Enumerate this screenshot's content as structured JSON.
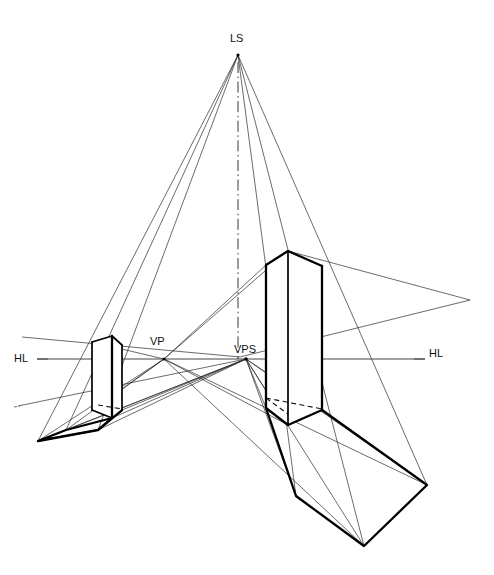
{
  "figure": {
    "type": "technical-line-drawing",
    "background_color": "#ffffff",
    "line_color": "#000000",
    "width": 494,
    "height": 575
  },
  "labels": {
    "light_source": "LS",
    "vanishing_point": "VP",
    "vanishing_point_shadow": "VPS",
    "horizon_left": "HL",
    "horizon_right": "HL"
  },
  "points": {
    "LS": {
      "x": 238,
      "y": 55,
      "label": "LS",
      "label_x": 232,
      "label_y": 40
    },
    "VP": {
      "x": 164,
      "y": 359,
      "label": "VP",
      "label_x": 152,
      "label_y": 347
    },
    "VPS": {
      "x": 246,
      "y": 359,
      "label": "VPS",
      "label_x": 235,
      "label_y": 351
    },
    "HL_left_label": {
      "label": "HL",
      "label_x": 16,
      "label_y": 359
    },
    "HL_right_label": {
      "label": "HL",
      "label_x": 430,
      "label_y": 357
    }
  },
  "horizon_line": {
    "left_x": 37,
    "right_x": 425,
    "y": 359
  },
  "center_line": {
    "x": 238,
    "top_y": 60,
    "bottom_y": 359
  },
  "left_object": {
    "name": "left-vertical-prism",
    "top_back_left": {
      "x": 92,
      "y": 342
    },
    "top_front": {
      "x": 112,
      "y": 336
    },
    "top_right": {
      "x": 122,
      "y": 345
    },
    "top_back_inner": {
      "x": 102,
      "y": 351
    },
    "bottom_back_left": {
      "x": 92,
      "y": 410
    },
    "bottom_front": {
      "x": 112,
      "y": 418
    },
    "bottom_right": {
      "x": 122,
      "y": 410
    }
  },
  "left_shadow": {
    "name": "left-object-cast-shadow",
    "corners": [
      {
        "x": 112,
        "y": 418
      },
      {
        "x": 66,
        "y": 430
      },
      {
        "x": 38,
        "y": 441
      },
      {
        "x": 98,
        "y": 430
      },
      {
        "x": 122,
        "y": 410
      }
    ]
  },
  "right_object": {
    "name": "right-vertical-prism",
    "top_peak": {
      "x": 288,
      "y": 251
    },
    "top_left": {
      "x": 266,
      "y": 265
    },
    "top_right": {
      "x": 322,
      "y": 266
    },
    "bottom_left": {
      "x": 266,
      "y": 408
    },
    "bottom_front": {
      "x": 288,
      "y": 425
    },
    "bottom_right": {
      "x": 322,
      "y": 410
    }
  },
  "right_shadow": {
    "name": "right-object-cast-shadow",
    "corners": [
      {
        "x": 266,
        "y": 408
      },
      {
        "x": 296,
        "y": 496
      },
      {
        "x": 364,
        "y": 546
      },
      {
        "x": 427,
        "y": 485
      },
      {
        "x": 322,
        "y": 410
      }
    ]
  },
  "light_rays": {
    "description": "rays from LS to object corners and shadow corners",
    "targets": [
      {
        "x": 38,
        "y": 441
      },
      {
        "x": 66,
        "y": 430
      },
      {
        "x": 98,
        "y": 430
      },
      {
        "x": 296,
        "y": 496
      },
      {
        "x": 364,
        "y": 546
      },
      {
        "x": 427,
        "y": 485
      }
    ]
  },
  "construction_lines": {
    "description": "perspective projector lines radiating from VP and VPS to object and shadow corners",
    "from_VP": [
      {
        "x": 22,
        "y": 337
      },
      {
        "x": 18,
        "y": 406
      },
      {
        "x": 322,
        "y": 266
      },
      {
        "x": 288,
        "y": 425
      },
      {
        "x": 364,
        "y": 546
      },
      {
        "x": 427,
        "y": 485
      }
    ],
    "from_VPS": [
      {
        "x": 38,
        "y": 441
      },
      {
        "x": 66,
        "y": 430
      },
      {
        "x": 98,
        "y": 430
      },
      {
        "x": 296,
        "y": 496
      },
      {
        "x": 364,
        "y": 546
      },
      {
        "x": 427,
        "y": 485
      },
      {
        "x": 470,
        "y": 300
      }
    ]
  }
}
